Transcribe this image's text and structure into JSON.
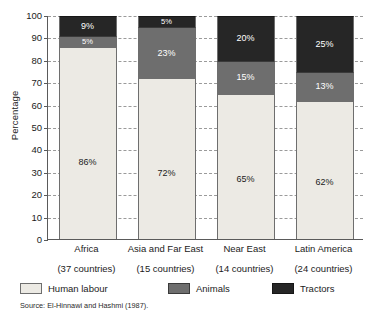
{
  "chart_data": {
    "type": "bar",
    "subtype": "stacked-100-percent",
    "title": "",
    "xlabel": "",
    "ylabel": "Percentage",
    "ylim": [
      0,
      100
    ],
    "yticks": [
      0,
      10,
      20,
      30,
      40,
      50,
      60,
      70,
      80,
      90,
      100
    ],
    "grid": true,
    "grid_style": "dashed-horizontal",
    "legend_position": "bottom",
    "categories": [
      "Africa",
      "Asia and Far East",
      "Near East",
      "Latin America"
    ],
    "category_sublabels": [
      "(37 countries)",
      "(15 countries)",
      "(14 countries)",
      "(24 countries)"
    ],
    "series": [
      {
        "name": "Human labour",
        "color": "#eceae4",
        "values": [
          86,
          72,
          65,
          62
        ],
        "labels": [
          "86%",
          "72%",
          "65%",
          "62%"
        ]
      },
      {
        "name": "Animals",
        "color": "#6e6e6e",
        "values": [
          5,
          23,
          15,
          13
        ],
        "labels": [
          "5%",
          "23%",
          "15%",
          "13%"
        ]
      },
      {
        "name": "Tractors",
        "color": "#262626",
        "values": [
          9,
          5,
          20,
          25
        ],
        "labels": [
          "9%",
          "5%",
          "20%",
          "25%"
        ]
      }
    ],
    "annotations": [
      "Source: El-Hinnawi and Hashmi (1987)."
    ]
  },
  "axis": {
    "y_title": "Percentage",
    "y_ticks": [
      "0",
      "10",
      "20",
      "30",
      "40",
      "50",
      "60",
      "70",
      "80",
      "90",
      "100"
    ]
  },
  "categories": [
    {
      "name": "Africa",
      "sub": "(37 countries)"
    },
    {
      "name": "Asia and Far East",
      "sub": "(15 countries)"
    },
    {
      "name": "Near East",
      "sub": "(14 countries)"
    },
    {
      "name": "Latin America",
      "sub": "(24 countries)"
    }
  ],
  "legend": [
    {
      "label": "Human labour",
      "color": "#eceae4"
    },
    {
      "label": "Animals",
      "color": "#6e6e6e"
    },
    {
      "label": "Tractors",
      "color": "#262626"
    }
  ],
  "source": "Source: El-Hinnawi and Hashmi (1987)."
}
